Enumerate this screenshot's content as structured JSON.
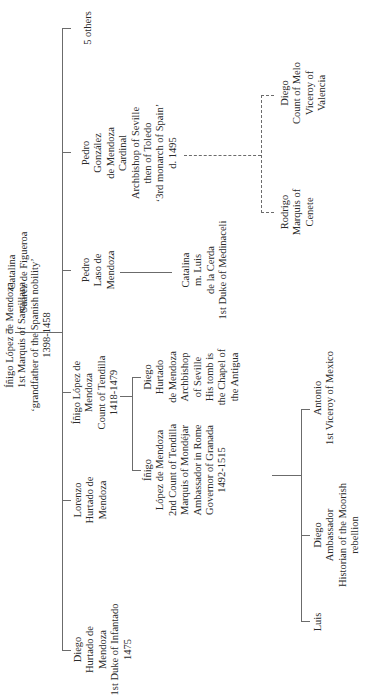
{
  "tree": {
    "couple": {
      "connector": "=",
      "patriarch": {
        "lines": [
          "Íñigo López de Mendoza",
          "1st Marquis of Santillana",
          "‘grandfather of the Spanish nobility’",
          "1398-1458"
        ]
      },
      "spouse": {
        "lines": [
          "Catalina",
          "Suárez de Figueroa"
        ]
      }
    },
    "children": [
      {
        "id": "diego",
        "lines": [
          "Diego",
          "Hurtado de",
          "Mendoza",
          "1st Duke of Infantado",
          "1475"
        ]
      },
      {
        "id": "lorenzo",
        "lines": [
          "Lorenzo",
          "Hurtado de",
          "Mendoza"
        ]
      },
      {
        "id": "inigo-count",
        "lines": [
          "Íñigo López de",
          "Mendoza",
          "Count of Tendilla",
          "1418-1479"
        ],
        "children": [
          {
            "id": "inigo-2nd",
            "lines": [
              "Íñigo",
              "López de Mendoza",
              "2nd Count of Tendilla",
              "Marquis of Mondéjar",
              "Ambassador in Rome",
              "Governor of Granada",
              "1492-1515"
            ],
            "children": [
              {
                "id": "luis",
                "lines": [
                  "Luis"
                ]
              },
              {
                "id": "diego-historian",
                "lines": [
                  "Diego",
                  "Ambassador",
                  "Historian of the Moorish",
                  "rebellion"
                ]
              },
              {
                "id": "antonio",
                "lines": [
                  "Antonio",
                  "1st Viceroy of Mexico"
                ]
              }
            ]
          },
          {
            "id": "diego-archbishop",
            "lines": [
              "Diego",
              "Hurtado",
              "de Mendoza",
              "Archbishop",
              "of Seville",
              "His tomb is",
              "the Chapel of",
              "the Antigua"
            ]
          }
        ]
      },
      {
        "id": "pedro-laso",
        "lines": [
          "Pedro",
          "Laso de",
          "Mendoza"
        ],
        "children": [
          {
            "id": "catalina-medinaceli",
            "lines": [
              "Catalina",
              "m. Luis",
              "de la Cerda",
              "1st Duke of Medinaceli"
            ]
          }
        ]
      },
      {
        "id": "pedro-gonzalez",
        "lines": [
          "Pedro",
          "González",
          "de Mendoza",
          "Cardinal",
          "Archbishop of Seville",
          "then of Toledo",
          "‘3rd monarch of Spain’",
          "d. 1495"
        ],
        "illegitimate_children": [
          {
            "id": "rodrigo",
            "lines": [
              "Rodrigo",
              "Marquis of",
              "Cenete"
            ]
          },
          {
            "id": "diego-melo",
            "lines": [
              "Diego",
              "Count of Melo",
              "Viceroy of",
              "Valencia"
            ]
          }
        ]
      },
      {
        "id": "others",
        "lines": [
          "5 others"
        ]
      }
    ]
  }
}
